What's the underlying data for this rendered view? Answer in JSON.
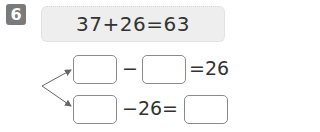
{
  "problem": {
    "number": "6",
    "equation": "37+26=63"
  },
  "derived": {
    "row1": {
      "operator": "−",
      "result_text": "=26"
    },
    "row2": {
      "expression_text": "−26="
    }
  },
  "colors": {
    "badge_bg": "#7a7a7a",
    "equation_bg": "#eeeeee",
    "box_border": "#8a8a8a",
    "arrow": "#666666"
  }
}
